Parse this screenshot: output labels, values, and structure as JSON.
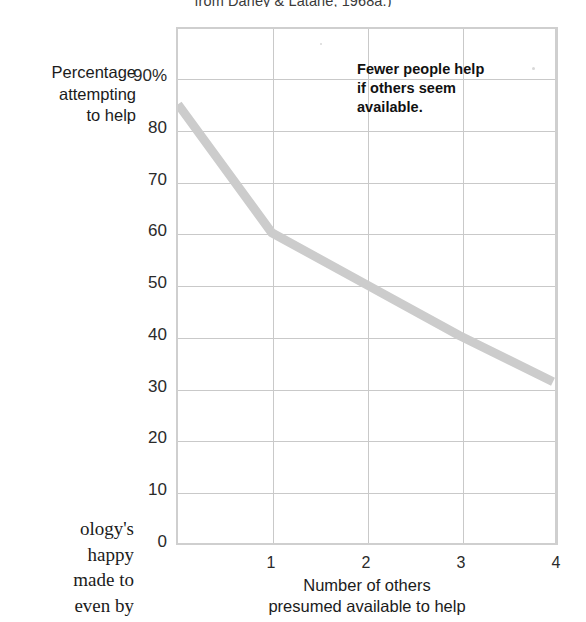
{
  "figure": {
    "caption_bleed": "from Darley & Latané, 1968a.)",
    "page_text_bleed": [
      "ology's",
      "happy",
      "made to",
      "even by"
    ]
  },
  "chart_data": {
    "type": "line",
    "title": "",
    "subtitle": "",
    "xlabel_line1": "Number of others",
    "xlabel_line2": "presumed available to help",
    "ylabel_line1": "Percentage",
    "ylabel_line2": "attempting",
    "ylabel_line3": "to help",
    "x": [
      0,
      1,
      2,
      3,
      4
    ],
    "values": [
      85,
      60,
      50,
      40,
      31
    ],
    "series": [
      {
        "name": "Percentage attempting to help",
        "values": [
          85,
          60,
          50,
          40,
          31
        ]
      }
    ],
    "xlim": [
      0,
      4
    ],
    "ylim": [
      0,
      90
    ],
    "xticks": [
      1,
      2,
      3,
      4
    ],
    "xtick_labels": [
      "1",
      "2",
      "3",
      "4"
    ],
    "yticks": [
      0,
      10,
      20,
      30,
      40,
      50,
      60,
      70,
      80,
      90
    ],
    "ytick_labels": [
      "0",
      "10",
      "20",
      "30",
      "40",
      "50",
      "60",
      "70",
      "80",
      "90%"
    ],
    "grid": true,
    "legend": "none",
    "annotations": [
      {
        "text_line1": "Fewer people help",
        "text_line2": "if others seem",
        "text_line3": "available."
      }
    ],
    "line_color": "#cccccc",
    "grid_color": "#c9c9c9",
    "frame_color": "#cfcfcf",
    "text_color": "#1b1b1b"
  }
}
